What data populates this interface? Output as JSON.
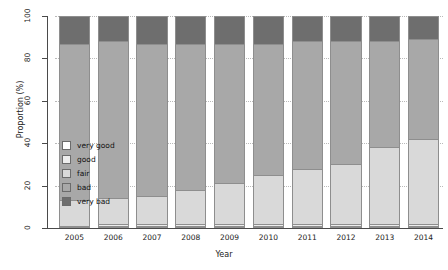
{
  "chart_data": {
    "type": "bar",
    "stacked": true,
    "title": "",
    "xlabel": "Year",
    "ylabel": "Proportion (%)",
    "categories": [
      "2005",
      "2006",
      "2007",
      "2008",
      "2009",
      "2010",
      "2011",
      "2012",
      "2013",
      "2014"
    ],
    "ylim": [
      0,
      100
    ],
    "yticks": [
      0,
      20,
      40,
      60,
      80,
      100
    ],
    "grid": "horizontal-dotted",
    "legend_position": "inside-left",
    "series": [
      {
        "name": "very good",
        "color": "#ffffff",
        "values": [
          1,
          1,
          1,
          1,
          1,
          1,
          1,
          1,
          1,
          1
        ]
      },
      {
        "name": "good",
        "color": "#ededed",
        "values": [
          0,
          1,
          1,
          1,
          1,
          1,
          1,
          1,
          1,
          1
        ]
      },
      {
        "name": "fair",
        "color": "#d9d9d9",
        "values": [
          12,
          12,
          13,
          16,
          19,
          23,
          26,
          28,
          36,
          40
        ]
      },
      {
        "name": "bad",
        "color": "#a8a8a8",
        "values": [
          74,
          74,
          72,
          69,
          66,
          62,
          60,
          58,
          50,
          47
        ]
      },
      {
        "name": "very bad",
        "color": "#6e6e6e",
        "values": [
          13,
          12,
          13,
          13,
          13,
          13,
          12,
          12,
          12,
          11
        ]
      }
    ]
  },
  "legend": {
    "items": [
      {
        "label": "very good",
        "color": "#ffffff"
      },
      {
        "label": "good",
        "color": "#ededed"
      },
      {
        "label": "fair",
        "color": "#d9d9d9"
      },
      {
        "label": "bad",
        "color": "#a8a8a8"
      },
      {
        "label": "very bad",
        "color": "#6e6e6e"
      }
    ]
  }
}
